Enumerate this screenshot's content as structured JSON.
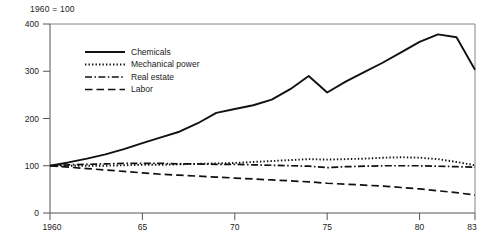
{
  "chart_data": {
    "type": "line",
    "title": "1960 = 100",
    "subtitle": "",
    "xlabel": "",
    "ylabel": "",
    "xlim": [
      1960,
      1983
    ],
    "ylim": [
      0,
      400
    ],
    "yticks": [
      0,
      100,
      200,
      300,
      400
    ],
    "ytick_labels": [
      "0",
      "100",
      "200",
      "300",
      "400"
    ],
    "xticks": [
      1960,
      1965,
      1970,
      1975,
      1980,
      1983
    ],
    "xtick_labels": [
      "1960",
      "65",
      "70",
      "75",
      "80",
      "83"
    ],
    "grid": false,
    "legend_position": "upper-left-inside",
    "x": [
      1960,
      1961,
      1962,
      1963,
      1964,
      1965,
      1966,
      1967,
      1968,
      1969,
      1970,
      1971,
      1972,
      1973,
      1974,
      1975,
      1976,
      1977,
      1978,
      1979,
      1980,
      1981,
      1982,
      1983
    ],
    "series": [
      {
        "name": "Chemicals",
        "style": "solid",
        "color": "#111111",
        "values": [
          100,
          107,
          115,
          124,
          135,
          148,
          160,
          172,
          190,
          212,
          220,
          228,
          240,
          262,
          290,
          255,
          278,
          298,
          318,
          340,
          362,
          378,
          372,
          303
        ]
      },
      {
        "name": "Mechanical power",
        "style": "dotted",
        "color": "#111111",
        "values": [
          100,
          100,
          100,
          100,
          101,
          102,
          102,
          103,
          104,
          105,
          106,
          108,
          110,
          112,
          114,
          113,
          114,
          115,
          117,
          118,
          117,
          114,
          108,
          101
        ]
      },
      {
        "name": "Real estate",
        "style": "dash-dot",
        "color": "#111111",
        "values": [
          100,
          102,
          103,
          104,
          105,
          105,
          105,
          104,
          104,
          103,
          103,
          102,
          101,
          100,
          99,
          96,
          98,
          99,
          100,
          100,
          100,
          99,
          98,
          97
        ]
      },
      {
        "name": "Labor",
        "style": "dashed",
        "color": "#111111",
        "values": [
          100,
          97,
          94,
          91,
          88,
          85,
          82,
          80,
          78,
          76,
          74,
          72,
          70,
          68,
          66,
          63,
          61,
          59,
          57,
          54,
          51,
          47,
          43,
          38
        ]
      }
    ]
  },
  "legend": {
    "items": [
      {
        "label": "Chemicals",
        "style": "solid"
      },
      {
        "label": "Mechanical power",
        "style": "dotted"
      },
      {
        "label": "Real estate",
        "style": "dash-dot"
      },
      {
        "label": "Labor",
        "style": "dashed"
      }
    ]
  },
  "caption": {
    "text": ""
  }
}
